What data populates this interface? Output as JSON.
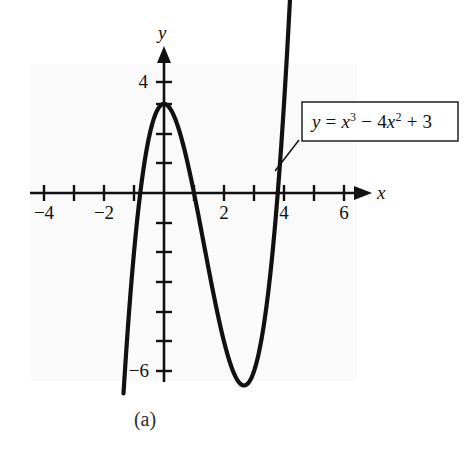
{
  "figure": {
    "caption": "(a)",
    "background_color": "#fafafa",
    "ink_color": "#111111"
  },
  "callout": {
    "equation_plain": "y = x^3 - 4x^2 + 3",
    "lhs": "y",
    "equals": " = ",
    "term1_base": "x",
    "term1_exp": "3",
    "minus": " − ",
    "term2_coef": "4",
    "term2_base": "x",
    "term2_exp": "2",
    "plus": " + ",
    "constant": "3"
  },
  "axes": {
    "x_name": "x",
    "y_name": "y",
    "x_labels": [
      {
        "value": -4,
        "text": "−4"
      },
      {
        "value": -2,
        "text": "−2"
      },
      {
        "value": 2,
        "text": "2"
      },
      {
        "value": 4,
        "text": "4"
      },
      {
        "value": 6,
        "text": "6"
      }
    ],
    "y_labels": [
      {
        "value": 4,
        "text": "4"
      },
      {
        "value": -6,
        "text": "−6"
      }
    ]
  },
  "chart_data": {
    "type": "line",
    "title": "",
    "subtitle": "",
    "xlabel": "x",
    "ylabel": "y",
    "xlim": [
      -4.6,
      6.9
    ],
    "ylim": [
      -6.6,
      4.4
    ],
    "grid": false,
    "legend_position": "callout-box-upper-right",
    "annotations": [
      {
        "text": "y = x³ − 4x² + 3",
        "kind": "callout",
        "points_to": [
          4.1,
          2.2
        ]
      },
      {
        "text": "(a)",
        "kind": "figure-caption"
      }
    ],
    "x_ticks": [
      -4,
      -3,
      -2,
      -1,
      0,
      1,
      2,
      3,
      4,
      5,
      6
    ],
    "x_tick_labels": [
      "−4",
      "",
      "−2",
      "",
      "",
      "",
      "2",
      "",
      "4",
      "",
      "6"
    ],
    "y_ticks": [
      4,
      3,
      2,
      1,
      0,
      -1,
      -2,
      -3,
      -4,
      -5,
      -6
    ],
    "y_tick_labels": [
      "4",
      "",
      "",
      "",
      "",
      "",
      "",
      "",
      "",
      "",
      "−6"
    ],
    "series": [
      {
        "name": "y = x^3 - 4x^2 + 3",
        "equation": "y = x^3 - 4x^2 + 3",
        "color": "#111111",
        "x": [
          -1.35,
          -1.2,
          -1.0,
          -0.8,
          -0.6,
          -0.4,
          -0.2,
          0.0,
          0.2,
          0.4,
          0.6,
          0.8,
          1.0,
          1.2,
          1.4,
          1.6,
          1.8,
          2.0,
          2.2,
          2.4,
          2.6,
          2.667,
          2.8,
          3.0,
          3.2,
          3.4,
          3.6,
          3.8,
          4.0,
          4.1,
          4.2,
          4.3,
          4.35
        ],
        "y": [
          -6.73,
          -4.49,
          -2.0,
          -0.07,
          1.34,
          2.3,
          2.83,
          3.0,
          2.85,
          2.42,
          1.78,
          0.95,
          0.0,
          -1.03,
          -2.09,
          -3.14,
          -4.13,
          -5.0,
          -5.72,
          -6.22,
          -6.46,
          -6.48,
          -6.41,
          -6.0,
          -5.19,
          -3.94,
          -2.18,
          -0.09,
          3.0,
          4.68,
          6.52,
          8.54,
          9.62
        ],
        "roots": [
          -0.791,
          1.0,
          3.791
        ],
        "local_max": {
          "x": 0.0,
          "y": 3.0
        },
        "local_min": {
          "x": 2.667,
          "y": -6.481
        }
      }
    ]
  }
}
